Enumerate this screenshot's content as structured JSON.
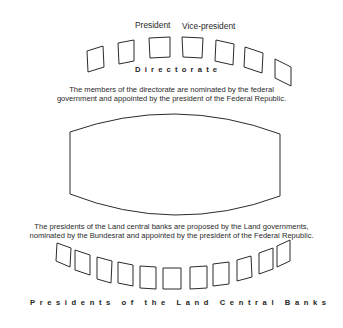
{
  "diagram": {
    "top_labels": {
      "president": "President",
      "vice_president": "Vice-president"
    },
    "directorate": {
      "title": "Directorate",
      "seat_count": 7,
      "description_line1": "The members of the directorate are nominated by the federal",
      "description_line2": "government and appointed by the president of the Federal Republic."
    },
    "central_council": {
      "shape": "lens"
    },
    "land_banks": {
      "description_line1": "The presidents of the Land central banks are proposed by the Land governments,",
      "description_line2": "nominated by the Bundesrat and appointed by the president of the Federal Republic.",
      "seat_count": 11,
      "title": "Presidents of the Land Central Banks"
    },
    "colors": {
      "stroke": "#2b2b2b",
      "background": "#ffffff"
    }
  }
}
